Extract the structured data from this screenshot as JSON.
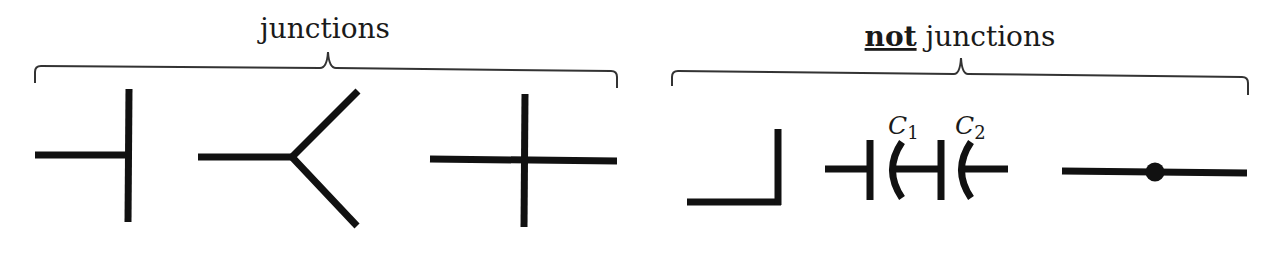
{
  "groups": {
    "left": {
      "title": "junctions",
      "items": [
        {
          "name": "T-junction",
          "description": "horizontal wire ending at vertical wire"
        },
        {
          "name": "Y-junction",
          "description": "horizontal wire splitting into two diagonal branches"
        },
        {
          "name": "cross-junction",
          "description": "horizontal and vertical wires crossing"
        }
      ]
    },
    "right": {
      "title_emphasis": "not",
      "title_rest": " junctions",
      "items": [
        {
          "name": "corner",
          "description": "wire bending at a right angle"
        },
        {
          "name": "series-capacitors",
          "description": "two capacitors in series",
          "labels": {
            "c1": "C",
            "c1_sub": "1",
            "c2": "C",
            "c2_sub": "2"
          }
        },
        {
          "name": "wire-with-dot",
          "description": "straight wire with a dot in the middle"
        }
      ]
    }
  },
  "colors": {
    "line": "#111111",
    "brace": "#333333",
    "background": "#ffffff"
  }
}
